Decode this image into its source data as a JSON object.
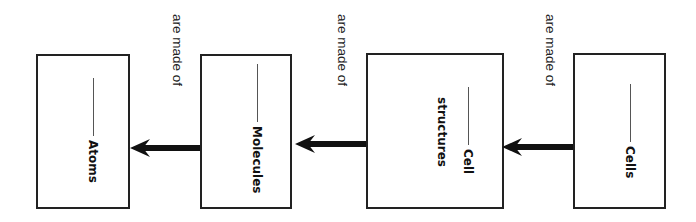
{
  "diagram": {
    "relation_label": "are made of",
    "boxes": [
      {
        "id": "atoms",
        "line1": "Atoms",
        "line2": ""
      },
      {
        "id": "molecules",
        "line1": "Molecules",
        "line2": ""
      },
      {
        "id": "cell-structures",
        "line1": "Cell",
        "line2": "structures"
      },
      {
        "id": "cells",
        "line1": "Cells",
        "line2": ""
      }
    ],
    "labels": [
      "are made of",
      "are made of",
      "are made of"
    ],
    "flow": "Cells -> Cell structures -> Molecules -> Atoms",
    "colors": {
      "stroke": "#222222",
      "background": "#ffffff"
    }
  }
}
